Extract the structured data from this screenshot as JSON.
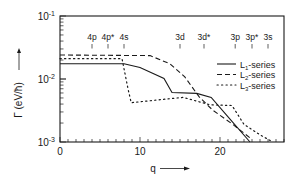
{
  "chart_data": {
    "type": "line",
    "title": "",
    "xlabel": "q",
    "ylabel": "Γ (eV/ħ)",
    "xlim": [
      0,
      28
    ],
    "ylim": [
      0.001,
      0.1
    ],
    "yscale": "log",
    "grid": false,
    "legend_position": "right-inside",
    "x_ticks": [
      0,
      10,
      20
    ],
    "x_minor_step": 1,
    "y_ticks": [
      {
        "value": 0.1,
        "base": "10",
        "exp": "-1"
      },
      {
        "value": 0.01,
        "base": "10",
        "exp": "-2"
      },
      {
        "value": 0.001,
        "base": "10",
        "exp": "-3"
      }
    ],
    "annotations": [
      {
        "label": "4p",
        "q": 4
      },
      {
        "label": "4p*",
        "q": 6
      },
      {
        "label": "4s",
        "q": 8
      },
      {
        "label": "3d",
        "q": 15
      },
      {
        "label": "3d*",
        "q": 18
      },
      {
        "label": "3p",
        "q": 21.9
      },
      {
        "label": "3p*",
        "q": 24
      },
      {
        "label": "3s",
        "q": 26
      }
    ],
    "series": [
      {
        "name": "L1-series",
        "label_main": "L",
        "label_sub": "1",
        "label_rest": "-series",
        "style": "solid",
        "x": [
          0,
          8,
          10,
          13,
          14,
          17.1,
          18.9,
          21.25,
          23.75
        ],
        "y": [
          0.0174,
          0.0174,
          0.0152,
          0.0102,
          0.0061,
          0.0059,
          0.0051,
          0.0023,
          0.001
        ]
      },
      {
        "name": "L2-series",
        "label_main": "L",
        "label_sub": "2",
        "label_rest": "-series",
        "style": "dashed",
        "x": [
          0,
          11.25,
          13.75,
          15.6,
          17.4,
          19.1,
          21.6,
          24
        ],
        "y": [
          0.024,
          0.0235,
          0.0174,
          0.0108,
          0.0052,
          0.0032,
          0.0019,
          0.0011
        ]
      },
      {
        "name": "L3-series",
        "label_main": "L",
        "label_sub": "3",
        "label_rest": "-series",
        "style": "dotted",
        "x": [
          0,
          7.75,
          8,
          8.5,
          8.9,
          12.5,
          15.4,
          18.75,
          21.5,
          23,
          25,
          26.6
        ],
        "y": [
          0.021,
          0.021,
          0.0146,
          0.007,
          0.0042,
          0.0047,
          0.0051,
          0.0039,
          0.0038,
          0.0019,
          0.0013,
          0.001
        ]
      }
    ]
  }
}
